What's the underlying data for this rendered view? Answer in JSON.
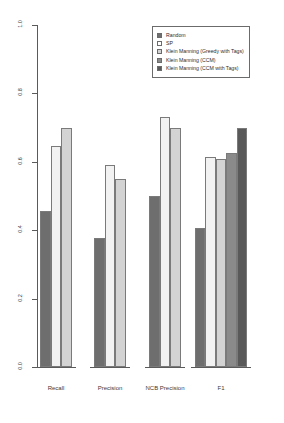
{
  "chart_data": {
    "type": "bar",
    "title": "",
    "xlabel": "",
    "ylabel": "",
    "ylim": [
      0.0,
      1.0
    ],
    "grid": false,
    "legend_position": "top-right",
    "categories": [
      "Recall",
      "Precision",
      "NCB Precision",
      "F1"
    ],
    "ytick_labels": [
      "0.0",
      "0.2",
      "0.4",
      "0.6",
      "0.8",
      "1.0"
    ],
    "ytick_values": [
      0.0,
      0.2,
      0.4,
      0.6,
      0.8,
      1.0
    ],
    "series": [
      {
        "name": "Random",
        "color": "#6e6e6e",
        "values": [
          0.455,
          0.378,
          0.5,
          0.405
        ]
      },
      {
        "name": "SP",
        "color": "#f2f2f2",
        "values": [
          0.645,
          0.59,
          0.73,
          0.615
        ]
      },
      {
        "name": "Klein Manning (Greedy with Tags)",
        "color": "#d3d3d3",
        "values": [
          0.7,
          0.55,
          0.7,
          0.607
        ]
      },
      {
        "name": "Klein Manning (CCM)",
        "color": "#8a8a8a",
        "values": [
          null,
          null,
          null,
          0.627
        ]
      },
      {
        "name": "Klein Manning (CCM with Tags)",
        "color": "#595959",
        "values": [
          null,
          null,
          null,
          0.7
        ]
      }
    ]
  },
  "legend": {
    "items": [
      {
        "label": "Random",
        "color": "#6e6e6e"
      },
      {
        "label": "SP",
        "color": "#ffffff"
      },
      {
        "label": "Klein Manning (Greedy with Tags)",
        "color": "#d3d3d3"
      },
      {
        "label": "Klein Manning (CCM)",
        "color": "#8a8a8a"
      },
      {
        "label": "Klein Manning (CCM with Tags)",
        "color": "#595959"
      }
    ]
  }
}
